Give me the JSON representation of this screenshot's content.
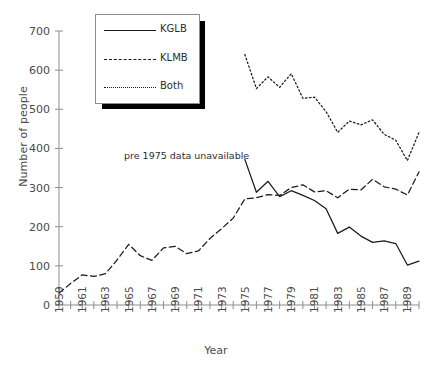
{
  "chart_data": {
    "type": "line",
    "title": "",
    "xlabel": "Year",
    "ylabel": "Number of people",
    "xlim": [
      1959,
      1990
    ],
    "ylim": [
      0,
      700
    ],
    "yticks": [
      0,
      100,
      200,
      300,
      400,
      500,
      600,
      700
    ],
    "xticks": [
      1959,
      1960,
      1961,
      1962,
      1963,
      1964,
      1965,
      1966,
      1967,
      1968,
      1969,
      1970,
      1971,
      1972,
      1973,
      1974,
      1975,
      1976,
      1977,
      1978,
      1979,
      1980,
      1981,
      1982,
      1983,
      1984,
      1985,
      1986,
      1987,
      1988,
      1989,
      1990
    ],
    "xtick_labels": [
      "1959",
      "",
      "1961",
      "",
      "1963",
      "",
      "1965",
      "",
      "1967",
      "",
      "1969",
      "",
      "1971",
      "",
      "1973",
      "",
      "1975",
      "",
      "1977",
      "",
      "1979",
      "",
      "1981",
      "",
      "1983",
      "",
      "1985",
      "",
      "1987",
      "",
      "1989",
      ""
    ],
    "grid": false,
    "legend_position": "top-left",
    "annotations": [
      {
        "text": "pre 1975 data unavailable",
        "x": 1964.6,
        "y": 372
      }
    ],
    "series": [
      {
        "name": "KGLB",
        "style": "solid",
        "x": [
          1975,
          1976,
          1977,
          1978,
          1979,
          1980,
          1981,
          1982,
          1983,
          1984,
          1985,
          1986,
          1987,
          1988,
          1989,
          1990
        ],
        "values": [
          372,
          288,
          316,
          277,
          292,
          280,
          267,
          246,
          183,
          199,
          176,
          160,
          164,
          157,
          102,
          112
        ]
      },
      {
        "name": "KLMB",
        "style": "dashed",
        "x": [
          1959,
          1960,
          1961,
          1962,
          1963,
          1964,
          1965,
          1966,
          1967,
          1968,
          1969,
          1970,
          1971,
          1972,
          1973,
          1974,
          1975,
          1976,
          1977,
          1978,
          1979,
          1980,
          1981,
          1982,
          1983,
          1984,
          1985,
          1986,
          1987,
          1988,
          1989,
          1990
        ],
        "values": [
          30,
          55,
          77,
          73,
          80,
          115,
          155,
          126,
          114,
          146,
          150,
          131,
          138,
          170,
          195,
          222,
          271,
          274,
          282,
          280,
          300,
          307,
          289,
          292,
          274,
          296,
          294,
          321,
          302,
          296,
          281,
          340
        ]
      },
      {
        "name": "Both",
        "style": "dotted",
        "x": [
          1975,
          1976,
          1977,
          1978,
          1979,
          1980,
          1981,
          1982,
          1983,
          1984,
          1985,
          1986,
          1987,
          1988,
          1989,
          1990
        ],
        "values": [
          640,
          553,
          583,
          556,
          591,
          528,
          531,
          494,
          441,
          470,
          460,
          473,
          436,
          421,
          369,
          441
        ]
      }
    ],
    "legend": [
      {
        "label": "KGLB",
        "style": "solid"
      },
      {
        "label": "KLMB",
        "style": "dashed"
      },
      {
        "label": "Both",
        "style": "dotted"
      }
    ],
    "colors": {
      "line": "#1b1b1b",
      "axis": "#8d8d8d",
      "text": "#4a4a4a"
    }
  }
}
